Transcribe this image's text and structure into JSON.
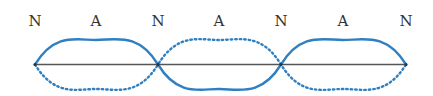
{
  "diagram": {
    "labels": [
      {
        "text": "N",
        "x": 35
      },
      {
        "text": "A",
        "x": 96
      },
      {
        "text": "N",
        "x": 158
      },
      {
        "text": "A",
        "x": 219
      },
      {
        "text": "N",
        "x": 281
      },
      {
        "text": "A",
        "x": 343
      },
      {
        "text": "N",
        "x": 406
      }
    ],
    "legend": {
      "N": "node",
      "A": "antinode"
    },
    "colors": {
      "wave": "#2f7fc1",
      "axis": "#444444",
      "label": "#333333"
    }
  }
}
